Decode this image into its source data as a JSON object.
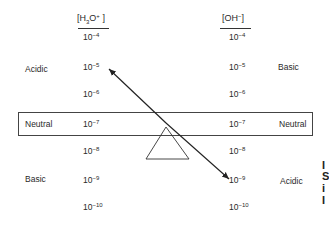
{
  "diagram": {
    "type": "seesaw-balance",
    "description_visible": "Balance of hydronium vs hydroxide concentrations around neutral point",
    "left_column": {
      "header_base": "[H",
      "header_sub": "3",
      "header_mid": "O",
      "header_sup": "+",
      "header_end": " ]",
      "values": [
        {
          "base": "10",
          "exp": "−4"
        },
        {
          "base": "10",
          "exp": "−5"
        },
        {
          "base": "10",
          "exp": "−6"
        },
        {
          "base": "10",
          "exp": "−7"
        },
        {
          "base": "10",
          "exp": "−8"
        },
        {
          "base": "10",
          "exp": "−9"
        },
        {
          "base": "10",
          "exp": "−10"
        }
      ]
    },
    "right_column": {
      "header_base": "[OH",
      "header_sup": "−",
      "header_end": "]",
      "values": [
        {
          "base": "10",
          "exp": "−4"
        },
        {
          "base": "10",
          "exp": "−5"
        },
        {
          "base": "10",
          "exp": "−6"
        },
        {
          "base": "10",
          "exp": "−7"
        },
        {
          "base": "10",
          "exp": "−8"
        },
        {
          "base": "10",
          "exp": "−9"
        },
        {
          "base": "10",
          "exp": "−10"
        }
      ]
    },
    "left_labels": {
      "acidic": "Acidic",
      "neutral": "Neutral",
      "basic": "Basic"
    },
    "right_labels": {
      "basic": "Basic",
      "neutral": "Neutral",
      "acidic": "Acidic"
    },
    "edge_clipped_text": [
      "I",
      "S",
      "i",
      "I"
    ],
    "colors": {
      "ink": "#2a2a2a",
      "box_border": "#444444",
      "background": "#ffffff"
    }
  }
}
